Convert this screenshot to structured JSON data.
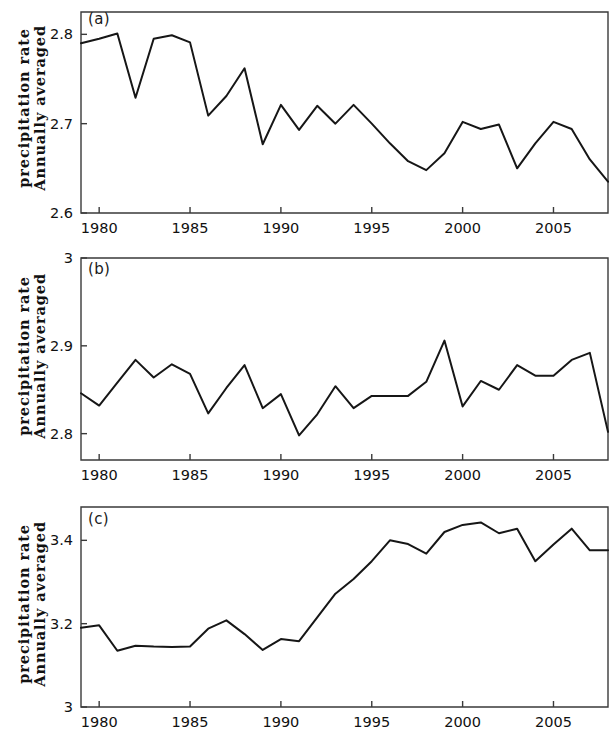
{
  "figure": {
    "background_color": "#ffffff",
    "line_color": "#161616",
    "axis_color": "#3a3a3a",
    "y_axis_title_line1": "Annually averaged",
    "y_axis_title_line2": "precipitation rate"
  },
  "panels": [
    {
      "tag": "(a)",
      "y_ticks": [
        "2.8",
        "2.7",
        "2.6"
      ],
      "x_ticks": [
        "1980",
        "1985",
        "1990",
        "1995",
        "2000",
        "2005"
      ]
    },
    {
      "tag": "(b)",
      "y_ticks": [
        "3",
        "2.9",
        "2.8"
      ],
      "x_ticks": [
        "1980",
        "1985",
        "1990",
        "1995",
        "2000",
        "2005"
      ]
    },
    {
      "tag": "(c)",
      "y_ticks": [
        "3.4",
        "3.2",
        "3"
      ],
      "x_ticks": [
        "1980",
        "1985",
        "1990",
        "1995",
        "2000",
        "2005"
      ]
    }
  ],
  "chart_data": [
    {
      "type": "line",
      "panel": "(a)",
      "title": "",
      "xlabel": "",
      "ylabel": "Annually averaged precipitation rate",
      "xlim": [
        1979,
        2008
      ],
      "ylim": [
        2.6,
        2.825
      ],
      "yticks": [
        2.8,
        2.7,
        2.6
      ],
      "ytick_labels": [
        "2.8",
        "2.7",
        "2.6"
      ],
      "xticks": [
        1980,
        1985,
        1990,
        1995,
        2000,
        2005
      ],
      "xtick_labels": [
        "1980",
        "1985",
        "1990",
        "1995",
        "2000",
        "2005"
      ],
      "grid": false,
      "legend": false,
      "x": [
        1979,
        1980,
        1981,
        1982,
        1983,
        1984,
        1985,
        1986,
        1987,
        1988,
        1989,
        1990,
        1991,
        1992,
        1993,
        1994,
        1995,
        1996,
        1997,
        1998,
        1999,
        2000,
        2001,
        2002,
        2003,
        2004,
        2005,
        2006,
        2007,
        2008
      ],
      "values": [
        2.79,
        2.795,
        2.801,
        2.729,
        2.795,
        2.799,
        2.791,
        2.709,
        2.731,
        2.762,
        2.677,
        2.721,
        2.693,
        2.72,
        2.7,
        2.721,
        2.7,
        2.678,
        2.658,
        2.648,
        2.667,
        2.702,
        2.694,
        2.699,
        2.65,
        2.678,
        2.702,
        2.694,
        2.66,
        2.635
      ]
    },
    {
      "type": "line",
      "panel": "(b)",
      "title": "",
      "xlabel": "",
      "ylabel": "Annually averaged precipitation rate",
      "xlim": [
        1979,
        2008
      ],
      "ylim": [
        2.77,
        3.0
      ],
      "yticks": [
        3.0,
        2.9,
        2.8
      ],
      "ytick_labels": [
        "3",
        "2.9",
        "2.8"
      ],
      "xticks": [
        1980,
        1985,
        1990,
        1995,
        2000,
        2005
      ],
      "xtick_labels": [
        "1980",
        "1985",
        "1990",
        "1995",
        "2000",
        "2005"
      ],
      "grid": false,
      "legend": false,
      "x": [
        1979,
        1980,
        1981,
        1982,
        1983,
        1984,
        1985,
        1986,
        1987,
        1988,
        1989,
        1990,
        1991,
        1992,
        1993,
        1994,
        1995,
        1996,
        1997,
        1998,
        1999,
        2000,
        2001,
        2002,
        2003,
        2004,
        2005,
        2006,
        2007,
        2008
      ],
      "values": [
        2.846,
        2.832,
        2.858,
        2.884,
        2.864,
        2.879,
        2.868,
        2.823,
        2.852,
        2.878,
        2.829,
        2.845,
        2.798,
        2.822,
        2.854,
        2.829,
        2.843,
        2.843,
        2.843,
        2.859,
        2.906,
        2.831,
        2.86,
        2.85,
        2.878,
        2.866,
        2.866,
        2.884,
        2.892,
        2.802
      ]
    },
    {
      "type": "line",
      "panel": "(c)",
      "title": "",
      "xlabel": "",
      "ylabel": "Annually averaged precipitation rate",
      "xlim": [
        1979,
        2008
      ],
      "ylim": [
        3.0,
        3.48
      ],
      "yticks": [
        3.4,
        3.2,
        3.0
      ],
      "ytick_labels": [
        "3.4",
        "3.2",
        "3"
      ],
      "xticks": [
        1980,
        1985,
        1990,
        1995,
        2000,
        2005
      ],
      "xtick_labels": [
        "1980",
        "1985",
        "1990",
        "1995",
        "2000",
        "2005"
      ],
      "grid": false,
      "legend": false,
      "x": [
        1979,
        1980,
        1981,
        1982,
        1983,
        1984,
        1985,
        1986,
        1987,
        1988,
        1989,
        1990,
        1991,
        1992,
        1993,
        1994,
        1995,
        1996,
        1997,
        1998,
        1999,
        2000,
        2001,
        2002,
        2003,
        2004,
        2005,
        2006,
        2007,
        2008
      ],
      "values": [
        3.19,
        3.196,
        3.135,
        3.147,
        3.145,
        3.144,
        3.145,
        3.188,
        3.208,
        3.175,
        3.137,
        3.163,
        3.158,
        3.215,
        3.272,
        3.307,
        3.35,
        3.4,
        3.391,
        3.368,
        3.42,
        3.437,
        3.443,
        3.417,
        3.428,
        3.35,
        3.39,
        3.428,
        3.376,
        3.376
      ]
    }
  ]
}
